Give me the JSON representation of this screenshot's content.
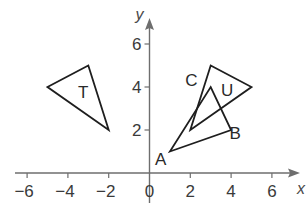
{
  "diagram": {
    "type": "coordinate-grid-transformation",
    "axes": {
      "x_label": "x",
      "y_label": "y",
      "x_ticks": [
        {
          "value": -6,
          "label": "−6"
        },
        {
          "value": -4,
          "label": "−4"
        },
        {
          "value": -2,
          "label": "−2"
        },
        {
          "value": 0,
          "label": "0"
        },
        {
          "value": 2,
          "label": "2"
        },
        {
          "value": 4,
          "label": "4"
        },
        {
          "value": 6,
          "label": "6"
        }
      ],
      "y_ticks": [
        {
          "value": 2,
          "label": "2"
        },
        {
          "value": 4,
          "label": "4"
        },
        {
          "value": 6,
          "label": "6"
        }
      ],
      "x_range": [
        -6.5,
        7
      ],
      "y_range": [
        0,
        7
      ]
    },
    "shapes": [
      {
        "name": "T",
        "label": "T",
        "vertices": [
          [
            -5,
            4
          ],
          [
            -3,
            5
          ],
          [
            -2,
            2
          ]
        ],
        "label_pos": [
          -3.25,
          3.5
        ]
      },
      {
        "name": "U",
        "label": "U",
        "vertices": [
          [
            3,
            5
          ],
          [
            5,
            4
          ],
          [
            2,
            2
          ]
        ],
        "label_pos": [
          3.8,
          3.6
        ]
      },
      {
        "name": "ABC",
        "label": "",
        "vertices": [
          [
            1,
            1
          ],
          [
            4,
            2
          ],
          [
            3,
            4
          ]
        ]
      }
    ],
    "vertex_labels": [
      {
        "label": "A",
        "pos": [
          0.55,
          0.35
        ]
      },
      {
        "label": "B",
        "pos": [
          4.2,
          1.6
        ]
      },
      {
        "label": "C",
        "pos": [
          2.05,
          4.05
        ]
      }
    ],
    "colors": {
      "axis": "#6e6e6e",
      "shape_stroke": "#1e1e1e",
      "text": "#3a3a3a",
      "background": "#ffffff"
    }
  }
}
